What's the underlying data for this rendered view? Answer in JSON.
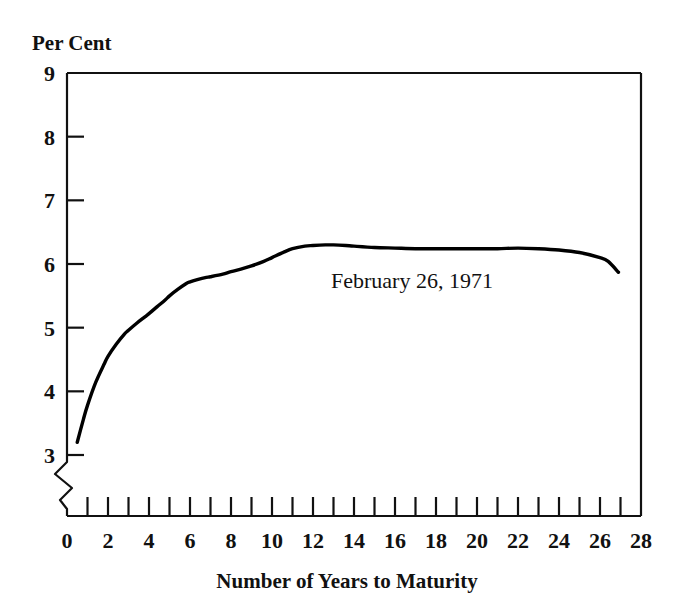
{
  "chart_data": {
    "type": "line",
    "title": "",
    "subtitle": "",
    "xlabel": "Number of Years to Maturity",
    "ylabel": "Per Cent",
    "ylabel_position": "above-axis-top-left",
    "xlim": [
      0,
      28
    ],
    "ylim": [
      3,
      9
    ],
    "y_axis_break": true,
    "y_axis_break_note": "zigzag break between baseline and 3 per cent",
    "grid": false,
    "legend": "none",
    "annotations": [
      {
        "text": "February 26, 1971",
        "x": 14.2,
        "y": 5.72,
        "anchor": "middle"
      }
    ],
    "x_ticks_major": [
      0,
      2,
      4,
      6,
      8,
      10,
      12,
      14,
      16,
      18,
      20,
      22,
      24,
      26,
      28
    ],
    "x_tick_labels": [
      "0",
      "2",
      "4",
      "6",
      "8",
      "10",
      "12",
      "14",
      "16",
      "18",
      "20",
      "22",
      "24",
      "26",
      "28"
    ],
    "x_ticks_minor": [
      1,
      3,
      5,
      7,
      9,
      11,
      13,
      15,
      17,
      19,
      21,
      23,
      25,
      27
    ],
    "y_ticks": [
      3,
      4,
      5,
      6,
      7,
      8,
      9
    ],
    "y_tick_labels": [
      "3",
      "4",
      "5",
      "6",
      "7",
      "8",
      "9"
    ],
    "series": [
      {
        "name": "February 26, 1971",
        "color": "#000000",
        "line_width": 3.4,
        "x": [
          0.5,
          0.8,
          1.0,
          1.4,
          1.8,
          2.0,
          2.4,
          2.8,
          3.0,
          3.4,
          3.8,
          4.0,
          4.4,
          4.8,
          5.0,
          5.4,
          5.8,
          6.0,
          6.4,
          6.8,
          7.0,
          7.6,
          8.0,
          8.6,
          9.0,
          9.6,
          10.0,
          10.6,
          11.0,
          11.6,
          12.0,
          12.6,
          13.0,
          13.6,
          14.0,
          15.0,
          16.0,
          17.0,
          18.0,
          19.0,
          20.0,
          21.0,
          22.0,
          23.0,
          24.0,
          25.0,
          26.0,
          26.4,
          26.9
        ],
        "values": [
          3.2,
          3.56,
          3.78,
          4.14,
          4.42,
          4.55,
          4.74,
          4.9,
          4.96,
          5.07,
          5.17,
          5.22,
          5.33,
          5.44,
          5.5,
          5.6,
          5.69,
          5.72,
          5.76,
          5.79,
          5.8,
          5.84,
          5.88,
          5.93,
          5.97,
          6.04,
          6.1,
          6.19,
          6.24,
          6.28,
          6.29,
          6.3,
          6.3,
          6.29,
          6.28,
          6.26,
          6.25,
          6.24,
          6.24,
          6.24,
          6.24,
          6.24,
          6.25,
          6.24,
          6.22,
          6.18,
          6.1,
          6.04,
          5.87
        ]
      }
    ]
  },
  "figure": {
    "y_axis_label": "Per Cent",
    "x_axis_label": "Number of Years to Maturity",
    "annotation_label": "February 26, 1971",
    "frame_color": "#111111",
    "series_color": "#000000",
    "background_color": "#ffffff"
  }
}
